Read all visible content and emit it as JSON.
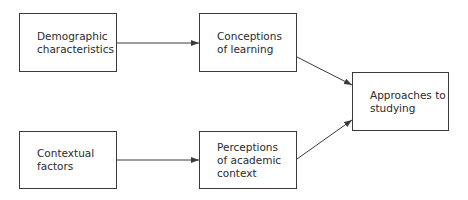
{
  "diagram": {
    "type": "flowchart",
    "nodes": [
      {
        "id": "demographic",
        "label": "Demographic\ncharacteristics",
        "x": 19,
        "y": 13,
        "w": 98,
        "h": 59
      },
      {
        "id": "conceptions",
        "label": "Conceptions\nof learning",
        "x": 199,
        "y": 13,
        "w": 98,
        "h": 59
      },
      {
        "id": "approaches",
        "label": "Approaches to\nstudying",
        "x": 352,
        "y": 72,
        "w": 97,
        "h": 59
      },
      {
        "id": "contextual",
        "label": "Contextual\nfactors",
        "x": 19,
        "y": 131,
        "w": 98,
        "h": 58
      },
      {
        "id": "perceptions",
        "label": "Perceptions\nof academic\ncontext",
        "x": 199,
        "y": 131,
        "w": 98,
        "h": 58
      }
    ],
    "edges": [
      {
        "from": "demographic",
        "to": "conceptions"
      },
      {
        "from": "conceptions",
        "to": "approaches"
      },
      {
        "from": "contextual",
        "to": "perceptions"
      },
      {
        "from": "perceptions",
        "to": "approaches"
      }
    ],
    "colors": {
      "stroke": "#3a3a3a",
      "text": "#2a2a2a",
      "background": "#ffffff"
    }
  }
}
